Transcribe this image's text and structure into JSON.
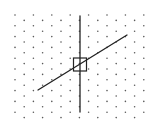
{
  "diagram": {
    "type": "staggered-dot-grid-with-lines",
    "width": 164,
    "height": 130,
    "background": "#ffffff",
    "grid": {
      "dot_color": "#5a5a5a",
      "dot_radius": 0.8,
      "columns_x": [
        15,
        24.2,
        33.4,
        42.6,
        51.8,
        61,
        70.2,
        79.4,
        88.6,
        97.8,
        107,
        116.2,
        125.4,
        134.6,
        143.8
      ],
      "even_column_start_y": 15,
      "odd_column_start_y": 20.4,
      "row_spacing": 10.8,
      "rows_per_column": 10
    },
    "lines": [
      {
        "name": "vertical-axis-line",
        "x1": 80,
        "y1": 16,
        "x2": 80,
        "y2": 112,
        "color": "#222222",
        "width": 1.3
      },
      {
        "name": "diagonal-line",
        "x1": 38,
        "y1": 90,
        "x2": 127,
        "y2": 35,
        "color": "#222222",
        "width": 1.3
      }
    ],
    "square": {
      "name": "center-square",
      "x": 73.5,
      "y": 58,
      "size": 13,
      "color": "#222222",
      "width": 1.2
    }
  }
}
